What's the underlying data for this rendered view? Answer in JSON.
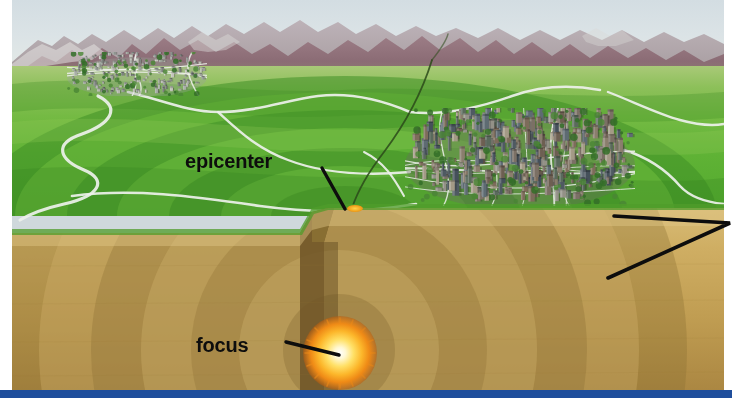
{
  "figure": {
    "type": "illustration",
    "labels": [
      {
        "id": "epicenter",
        "text": "epicenter",
        "description": "point on the ground surface directly above the focus",
        "x": 252,
        "y": 164,
        "leader_from": [
          322,
          168
        ],
        "leader_to": [
          345,
          209
        ]
      },
      {
        "id": "focus",
        "text": "focus",
        "description": "point underground where the earthquake originates",
        "x": 228,
        "y": 348,
        "leader_from": [
          286,
          342
        ],
        "leader_to": [
          339,
          355
        ]
      }
    ],
    "callouts": [
      {
        "id": "seismic-waves-upper",
        "from": [
          614,
          216
        ],
        "to": [
          730,
          223
        ],
        "description": "leader line to off-screen seismic wave label"
      },
      {
        "id": "seismic-waves-lower",
        "from": [
          608,
          278
        ],
        "to": [
          730,
          223
        ],
        "description": "leader line to off-screen seismic wave label"
      }
    ],
    "elements": [
      {
        "name": "sky",
        "color": "#dbe3e6"
      },
      {
        "name": "mountain-range",
        "color": "#8e6d74"
      },
      {
        "name": "green-hills",
        "color": "#5fb235"
      },
      {
        "name": "distant-city",
        "color": "#9aa39a"
      },
      {
        "name": "main-city",
        "color": "#6e6a63"
      },
      {
        "name": "rivers-and-roads",
        "color": "#e8ece8"
      },
      {
        "name": "fault-line",
        "color": "#2f4d1c"
      },
      {
        "name": "fault-plane",
        "color": "#6b5630"
      },
      {
        "name": "bedrock-cross-section",
        "color": "#c4a159"
      },
      {
        "name": "seismic-wave-bands",
        "color": "#8f7438"
      },
      {
        "name": "focus-burst",
        "color": "#ffd24a"
      },
      {
        "name": "epicenter-marker",
        "color": "#f2a21c"
      },
      {
        "name": "bottom-rule",
        "color": "#1f4e9c"
      }
    ],
    "colors": {
      "sky": "#dbe3e6",
      "mountains": "#8e6d74",
      "grass_light": "#74ba43",
      "grass_dark": "#3f8f26",
      "soil_light": "#cdae68",
      "soil_dark": "#8d7038",
      "focus_core": "#ffffff",
      "focus_ring": "#f5a623",
      "leader_line": "#0d0d0d",
      "accent_rule": "#1f4e9c",
      "label_text": "#0d0d0d"
    }
  }
}
